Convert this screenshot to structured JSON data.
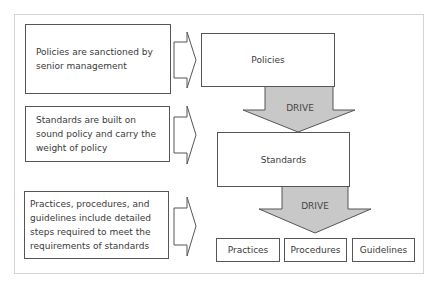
{
  "descriptions": [
    {
      "text": "Policies are sanctioned by senior management"
    },
    {
      "text": "Standards are built on sound policy and carry the weight of policy"
    },
    {
      "text": "Practices, procedures, and guidelines include detailed steps required to meet the requirements of standards"
    }
  ],
  "hierarchy": {
    "policies": "Policies",
    "standards": "Standards",
    "drive_label_1": "DRIVE",
    "drive_label_2": "DRIVE",
    "bottom": [
      {
        "label": "Practices"
      },
      {
        "label": "Procedures"
      },
      {
        "label": "Guidelines"
      }
    ]
  },
  "colors": {
    "drive_arrow_fill": "#c8c8c8",
    "border": "#555555",
    "frame": "#d4d4d4"
  }
}
